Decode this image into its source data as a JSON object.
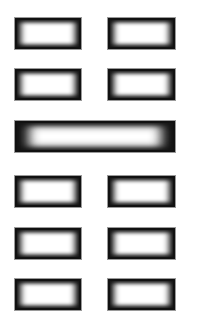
{
  "figure": {
    "lines": [
      {
        "position": 1,
        "type": "broken",
        "segments": 2,
        "top": 17
      },
      {
        "position": 2,
        "type": "broken",
        "segments": 2,
        "top": 68
      },
      {
        "position": 3,
        "type": "solid",
        "segments": 1,
        "top": 120
      },
      {
        "position": 4,
        "type": "broken",
        "segments": 2,
        "top": 175
      },
      {
        "position": 5,
        "type": "broken",
        "segments": 2,
        "top": 227
      },
      {
        "position": 6,
        "type": "broken",
        "segments": 2,
        "top": 278
      }
    ],
    "colors": {
      "background": "#ffffff",
      "bar_edge": "#111111",
      "bar_fill": "#ffffff",
      "outline": "#9a9a9a"
    }
  }
}
